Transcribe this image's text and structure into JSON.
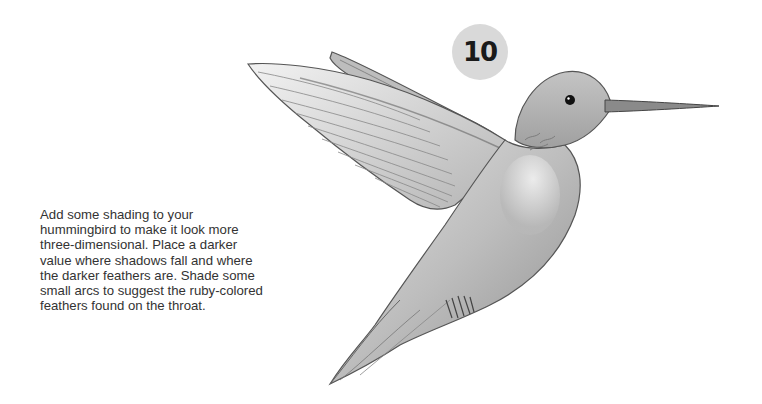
{
  "step": {
    "number": "10"
  },
  "instructions": {
    "text": "Add some shading to your hummingbird to make it look more three-dimensional. Place a darker value where shadows fall and where the darker feathers are. Shade some small arcs to suggest the ruby-colored feathers found on the throat."
  },
  "illustration": {
    "subject": "hummingbird-pencil-drawing",
    "colors": {
      "badge": "#d9d9d9",
      "text": "#333333",
      "pencil_dark": "#3a3a3a",
      "pencil_mid": "#8a8a8a",
      "pencil_light": "#c8c8c8"
    }
  }
}
